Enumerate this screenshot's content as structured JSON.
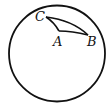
{
  "diagram": {
    "type": "spherical-triangle-on-sphere",
    "sphere": {
      "cx": 57,
      "cy": 53.5,
      "r": 48,
      "stroke": "#111111"
    },
    "vertices": {
      "A": {
        "label": "A",
        "x": 59,
        "y": 31,
        "label_x": 53,
        "label_y": 46
      },
      "B": {
        "label": "B",
        "x": 88,
        "y": 35,
        "label_x": 87,
        "label_y": 46
      },
      "C": {
        "label": "C",
        "x": 46,
        "y": 17,
        "label_x": 35,
        "label_y": 21
      }
    }
  }
}
